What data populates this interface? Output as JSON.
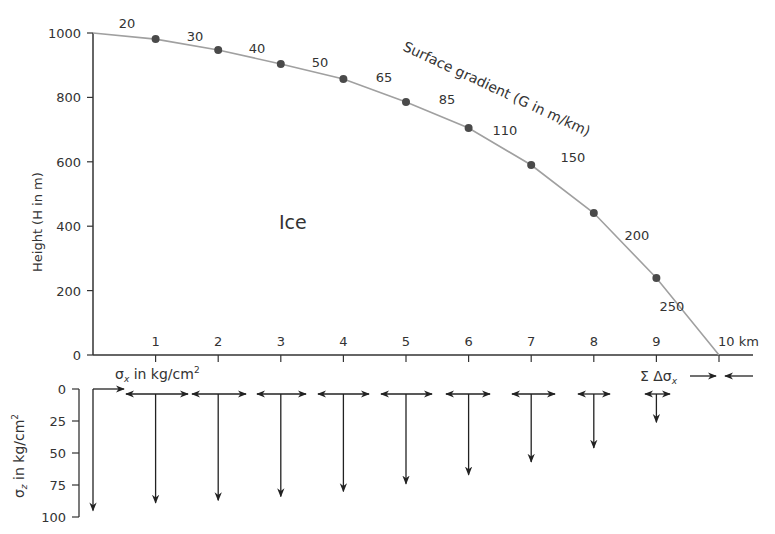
{
  "chart_data": [
    {
      "type": "line",
      "title": "",
      "region_label": "Ice",
      "xlabel": "km",
      "ylabel": "Height (H in m)",
      "curve_label": "Surface gradient (G in m/km)",
      "x_ticks": [
        1,
        2,
        3,
        4,
        5,
        6,
        7,
        8,
        9,
        10
      ],
      "x_tick_labels": [
        "1",
        "2",
        "3",
        "4",
        "5",
        "6",
        "7",
        "8",
        "9",
        "10 km"
      ],
      "y_ticks": [
        0,
        200,
        400,
        600,
        800,
        1000
      ],
      "xlim": [
        0,
        10
      ],
      "ylim": [
        0,
        1000
      ],
      "x": [
        0,
        1,
        2,
        3,
        4,
        5,
        6,
        7,
        8,
        9,
        10
      ],
      "height": [
        1000,
        981,
        947,
        904,
        857,
        786,
        705,
        590,
        441,
        239,
        0
      ],
      "markers_at": [
        1,
        2,
        3,
        4,
        5,
        6,
        7,
        8,
        9
      ],
      "gradient_labels": [
        {
          "segment": "0-1",
          "value": "20"
        },
        {
          "segment": "1-2",
          "value": "30"
        },
        {
          "segment": "2-3",
          "value": "40"
        },
        {
          "segment": "3-4",
          "value": "50"
        },
        {
          "segment": "4-5",
          "value": "65"
        },
        {
          "segment": "5-6",
          "value": "85"
        },
        {
          "segment": "6-7",
          "value": "110"
        },
        {
          "segment": "7-8",
          "value": "150"
        },
        {
          "segment": "8-9",
          "value": "200"
        },
        {
          "segment": "9-10",
          "value": "250"
        }
      ]
    },
    {
      "type": "vector",
      "xlabel": "σx in kg/cm²",
      "ylabel": "σz in kg/cm²",
      "y_ticks": [
        0,
        25,
        50,
        75,
        100
      ],
      "ylim": [
        0,
        100
      ],
      "x": [
        0,
        1,
        2,
        3,
        4,
        5,
        6,
        7,
        8,
        9
      ],
      "sigma_z": [
        95,
        89,
        87,
        84,
        80,
        74,
        67,
        57,
        46,
        26
      ],
      "sigma_x_halfwidth_km": [
        0.5,
        0.5,
        0.43,
        0.39,
        0.4,
        0.41,
        0.36,
        0.34,
        0.26,
        0.2
      ],
      "annotation": "Σ Δσx"
    }
  ],
  "labels": {
    "ice": "Ice",
    "curve": "Surface gradient (G in m/km)",
    "y_axis_top": "Height (H in m)",
    "sigma_x": "σ",
    "sigma_x_sub": "x",
    "sigma_x_rest": " in kg/cm",
    "sup2": "2",
    "sigma_z": "σ",
    "sigma_z_sub": "z",
    "sigma_z_rest": " in kg/cm",
    "sum_label": "Σ  Δσ",
    "sum_sub": "x"
  },
  "colors": {
    "curve": "#a0a0a0",
    "marker": "#4a4a4a",
    "axis": "#333333",
    "arrow": "#222222"
  }
}
